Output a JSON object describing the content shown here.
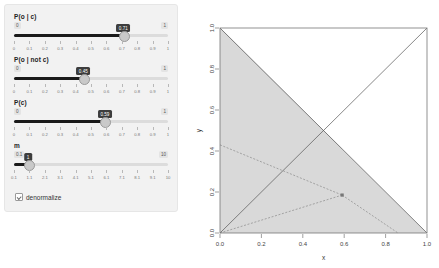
{
  "panel": {
    "sliders": [
      {
        "name": "p-o-given-c",
        "label": "P(o | c)",
        "min_label": "0",
        "max_label": "1",
        "value": 0.71,
        "value_label": "0.71",
        "min": 0,
        "max": 1,
        "ticks": [
          "0",
          "0.1",
          "0.2",
          "0.3",
          "0.4",
          "0.5",
          "0.6",
          "0.7",
          "0.8",
          "0.9",
          "1"
        ]
      },
      {
        "name": "p-o-given-not-c",
        "label": "P(o | not c)",
        "min_label": "0",
        "max_label": "1",
        "value": 0.45,
        "value_label": "0.45",
        "min": 0,
        "max": 1,
        "ticks": [
          "0",
          "0.1",
          "0.2",
          "0.3",
          "0.4",
          "0.5",
          "0.6",
          "0.7",
          "0.8",
          "0.9",
          "1"
        ]
      },
      {
        "name": "p-c",
        "label": "P(c)",
        "min_label": "0",
        "max_label": "1",
        "value": 0.59,
        "value_label": "0.59",
        "min": 0,
        "max": 1,
        "ticks": [
          "0",
          "0.1",
          "0.2",
          "0.3",
          "0.4",
          "0.5",
          "0.6",
          "0.7",
          "0.8",
          "0.9",
          "1"
        ]
      },
      {
        "name": "m",
        "label": "m",
        "min_label": "0.1",
        "max_label": "10",
        "value": 1,
        "value_label": "1",
        "min": 0.1,
        "max": 10,
        "ticks": [
          "0.1",
          "1.1",
          "2.1",
          "3.1",
          "4.1",
          "5.1",
          "6.1",
          "7.1",
          "8.1",
          "9.1",
          "10"
        ]
      }
    ],
    "checkbox": {
      "label": "denormalize",
      "checked": true
    }
  },
  "chart_data": {
    "type": "area",
    "title": "",
    "xlabel": "x",
    "ylabel": "y",
    "xlim": [
      0,
      1
    ],
    "ylim": [
      0,
      1
    ],
    "xticks": [
      "0.0",
      "0.2",
      "0.4",
      "0.6",
      "0.8",
      "1.0"
    ],
    "yticks": [
      "0.0",
      "0.2",
      "0.4",
      "0.6",
      "0.8",
      "1.0"
    ],
    "grid": false,
    "legend": null,
    "regions": [
      {
        "name": "dark-region",
        "color": "#999999",
        "polygon": [
          [
            0,
            0
          ],
          [
            0,
            1
          ],
          [
            0.59,
            0.41
          ],
          [
            0,
            0
          ]
        ],
        "description": "dark gray triangle upper-left"
      },
      {
        "name": "light-region",
        "color": "#d9d9d9",
        "polygon": [
          [
            0,
            0
          ],
          [
            1,
            0
          ],
          [
            0,
            1
          ]
        ],
        "description": "light gray triangle lower-right below anti-diagonal"
      }
    ],
    "lines": [
      {
        "name": "diagonal-up",
        "points": [
          [
            0,
            0
          ],
          [
            1,
            1
          ]
        ],
        "style": "solid",
        "color": "#555555"
      },
      {
        "name": "anti-diagonal",
        "points": [
          [
            0,
            1
          ],
          [
            1,
            0
          ]
        ],
        "style": "solid",
        "color": "#555555"
      },
      {
        "name": "curve-left",
        "points": [
          [
            0,
            0.43
          ],
          [
            0.59,
            0.185
          ]
        ],
        "style": "dashed",
        "color": "#8a8a8a"
      },
      {
        "name": "curve-lower",
        "points": [
          [
            0,
            0.0
          ],
          [
            0.59,
            0.185
          ]
        ],
        "style": "dashed",
        "color": "#8a8a8a"
      },
      {
        "name": "curve-right",
        "points": [
          [
            0.59,
            0.185
          ],
          [
            0.86,
            0.0
          ]
        ],
        "style": "dashed",
        "color": "#8a8a8a"
      }
    ],
    "points": [
      {
        "name": "marker-point",
        "x": 0.59,
        "y": 0.185,
        "color": "#777777",
        "shape": "square"
      }
    ]
  }
}
